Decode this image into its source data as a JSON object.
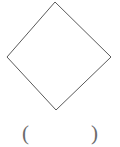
{
  "figure": {
    "background_color": "#ffffff",
    "stroke_color": "#5a5a5a",
    "stroke_width": 1,
    "shape": {
      "name": "rhombus",
      "label": "diamond-outline",
      "fill": "none",
      "points": "55,2 111,57 56,110 7,57",
      "vertices": [
        {
          "name": "top",
          "x": 55,
          "y": 2
        },
        {
          "name": "right",
          "x": 111,
          "y": 57
        },
        {
          "name": "bottom",
          "x": 56,
          "y": 110
        },
        {
          "name": "left",
          "x": 7,
          "y": 57
        }
      ]
    }
  },
  "answer": {
    "open_paren": "(",
    "close_paren": ")",
    "value": "",
    "placeholder": ""
  }
}
